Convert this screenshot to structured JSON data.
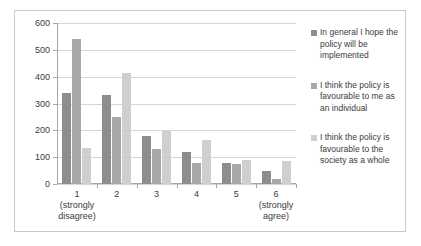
{
  "chart_data": {
    "type": "bar",
    "title": "",
    "subtitle": "",
    "xlabel": "",
    "ylabel": "",
    "ylim": [
      0,
      600
    ],
    "ytick_interval": 100,
    "yticks": [
      600,
      500,
      400,
      300,
      200,
      100,
      0
    ],
    "grid": true,
    "legend_position": "right",
    "categories": [
      "1",
      "2",
      "3",
      "4",
      "5",
      "6"
    ],
    "category_sublabels": [
      "(strongly disagree)",
      "",
      "",
      "",
      "",
      "(strongly agree)"
    ],
    "category_labels_full": [
      "1\n(strongly\ndisagree)",
      "2",
      "3",
      "4",
      "5",
      "6\n(strongly\nagree)"
    ],
    "series": [
      {
        "name": "In general I hope the policy will be implemented",
        "color": "#8d8d8d",
        "values": [
          338,
          332,
          178,
          118,
          80,
          50
        ]
      },
      {
        "name": "I think the policy is favourable to me as an individual",
        "color": "#a8a8a8",
        "values": [
          540,
          250,
          130,
          78,
          73,
          20
        ]
      },
      {
        "name": "I think the policy is favourable to the society as a whole",
        "color": "#cfcfcf",
        "values": [
          133,
          413,
          198,
          165,
          90,
          87
        ]
      }
    ]
  },
  "axis": {
    "y_tick_labels": [
      "600",
      "500",
      "400",
      "300",
      "200",
      "100",
      "0"
    ],
    "x_tick_groups": [
      {
        "number": "1",
        "line2": "(strongly",
        "line3": "disagree)"
      },
      {
        "number": "2",
        "line2": "",
        "line3": ""
      },
      {
        "number": "3",
        "line2": "",
        "line3": ""
      },
      {
        "number": "4",
        "line2": "",
        "line3": ""
      },
      {
        "number": "5",
        "line2": "",
        "line3": ""
      },
      {
        "number": "6",
        "line2": "(strongly",
        "line3": "agree)"
      }
    ]
  },
  "legend": {
    "entries": [
      {
        "label": "In general I hope the policy will be implemented",
        "color": "#8d8d8d"
      },
      {
        "label": "I think the policy is favourable to me as an individual",
        "color": "#a8a8a8"
      },
      {
        "label": "I think the policy is favourable to the society as a whole",
        "color": "#cfcfcf"
      }
    ]
  },
  "colors": {
    "series_1": "#8d8d8d",
    "series_2": "#a8a8a8",
    "series_3": "#cfcfcf",
    "gridline": "#d6d6d6",
    "axis": "#a6a6a6",
    "border": "#c9c9c9",
    "text": "#3b3b3b"
  }
}
